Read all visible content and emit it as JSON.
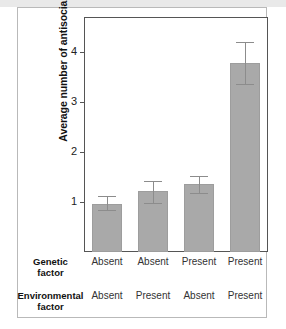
{
  "chart_data": {
    "type": "bar",
    "title": "",
    "xlabel": "",
    "ylabel": "Average number of antisocial behaviors",
    "ylim": [
      0,
      4.7
    ],
    "yticks": [
      1,
      2,
      3,
      4
    ],
    "ytick_labels": [
      "1",
      "2",
      "3",
      "4"
    ],
    "grid": false,
    "legend": "none",
    "bar_color": "#a9a9a9",
    "error_color": "#8c8c8c",
    "categories": [
      "Genetic Absent / Environmental Absent",
      "Genetic Absent / Environmental Present",
      "Genetic Present / Environmental Absent",
      "Genetic Present / Environmental Present"
    ],
    "values": [
      0.96,
      1.22,
      1.37,
      3.78
    ],
    "error_upper": [
      1.13,
      1.43,
      1.53,
      4.2
    ],
    "error_lower": [
      0.82,
      0.96,
      1.17,
      3.35
    ],
    "group_labels": {
      "genetic_factor": [
        "Absent",
        "Absent",
        "Present",
        "Present"
      ],
      "environmental_factor": [
        "Absent",
        "Present",
        "Absent",
        "Present"
      ]
    }
  },
  "axes": {
    "y_label": "Average number of antisocial behaviors"
  },
  "factors": [
    {
      "name": "genetic",
      "title_line1": "Genetic",
      "title_line2": "factor",
      "values": [
        "Absent",
        "Absent",
        "Present",
        "Present"
      ]
    },
    {
      "name": "environmental",
      "title_line1": "Environmental",
      "title_line2": "factor",
      "values": [
        "Absent",
        "Present",
        "Absent",
        "Present"
      ]
    }
  ]
}
